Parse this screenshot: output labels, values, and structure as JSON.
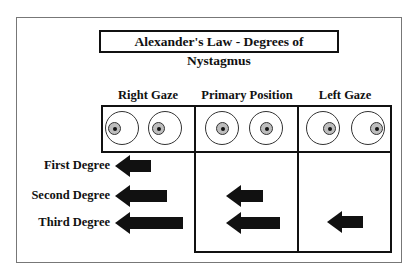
{
  "title": "Alexander's Law - Degrees of Nystagmus",
  "columns": [
    {
      "label": "Right Gaze",
      "gaze": "right"
    },
    {
      "label": "Primary Position",
      "gaze": "primary"
    },
    {
      "label": "Left Gaze",
      "gaze": "left"
    }
  ],
  "rows": [
    {
      "label": "First Degree",
      "arrows": {
        "right_gaze": true,
        "primary": false,
        "left_gaze": false
      }
    },
    {
      "label": "Second Degree",
      "arrows": {
        "right_gaze": true,
        "primary": true,
        "left_gaze": false
      }
    },
    {
      "label": "Third Degree",
      "arrows": {
        "right_gaze": true,
        "primary": true,
        "left_gaze": true
      }
    }
  ],
  "arrow_direction": "left",
  "colors": {
    "line": "#111111",
    "iris": "#bdbdbd",
    "frame": "#777777"
  }
}
